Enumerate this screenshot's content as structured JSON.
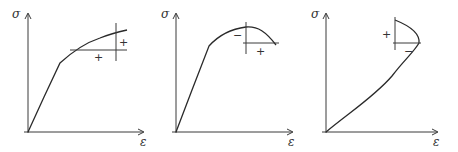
{
  "figure": {
    "panels": [
      {
        "id": "a",
        "y_axis_label": "σ",
        "x_axis_label": "ε",
        "curve": "hardening",
        "signs": [
          "+",
          "+"
        ]
      },
      {
        "id": "b",
        "y_axis_label": "σ",
        "x_axis_label": "ε",
        "curve": "softening",
        "signs": [
          "−",
          "+"
        ]
      },
      {
        "id": "c",
        "y_axis_label": "σ",
        "x_axis_label": "ε",
        "curve": "snap-back",
        "signs": [
          "+",
          "−"
        ]
      }
    ]
  }
}
